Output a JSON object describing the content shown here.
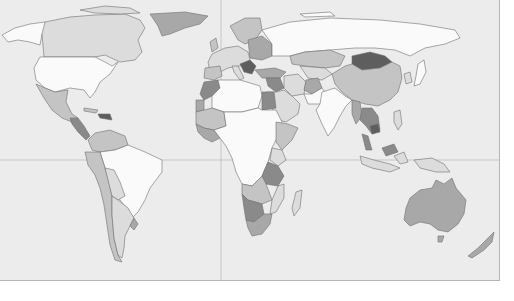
{
  "map": {
    "type": "choropleth-world-map",
    "colors": {
      "ocean": "#ececec",
      "frame_border": "#b5b5b5",
      "gridline": "#b8b8b8",
      "country_border": "#6e6e6e",
      "shade_0": "#fafafa",
      "shade_1": "#dcdcdc",
      "shade_2": "#c4c4c4",
      "shade_3": "#a8a8a8",
      "shade_4": "#8a8a8a",
      "shade_5": "#5e5e5e"
    },
    "gridlines": {
      "prime_meridian_x": 221,
      "equator_y": 160
    },
    "regions": [
      {
        "name": "alaska",
        "shade": "shade_0"
      },
      {
        "name": "canada",
        "shade": "shade_1"
      },
      {
        "name": "greenland",
        "shade": "shade_3"
      },
      {
        "name": "usa",
        "shade": "shade_0"
      },
      {
        "name": "mexico",
        "shade": "shade_2"
      },
      {
        "name": "central-america",
        "shade": "shade_4"
      },
      {
        "name": "caribbean",
        "shade": "shade_5"
      },
      {
        "name": "colombia-venezuela",
        "shade": "shade_2"
      },
      {
        "name": "brazil",
        "shade": "shade_0"
      },
      {
        "name": "peru-chile",
        "shade": "shade_2"
      },
      {
        "name": "bolivia-paraguay",
        "shade": "shade_1"
      },
      {
        "name": "argentina",
        "shade": "shade_1"
      },
      {
        "name": "uruguay",
        "shade": "shade_3"
      },
      {
        "name": "europe",
        "shade": "shade_2"
      },
      {
        "name": "balkans",
        "shade": "shade_5"
      },
      {
        "name": "russia",
        "shade": "shade_0"
      },
      {
        "name": "kazakhstan",
        "shade": "shade_2"
      },
      {
        "name": "mongolia",
        "shade": "shade_5"
      },
      {
        "name": "china",
        "shade": "shade_2"
      },
      {
        "name": "india",
        "shade": "shade_0"
      },
      {
        "name": "middle-east",
        "shade": "shade_1"
      },
      {
        "name": "turkey",
        "shade": "shade_3"
      },
      {
        "name": "iraq-syria",
        "shade": "shade_4"
      },
      {
        "name": "afghanistan",
        "shade": "shade_3"
      },
      {
        "name": "egypt",
        "shade": "shade_4"
      },
      {
        "name": "morocco",
        "shade": "shade_4"
      },
      {
        "name": "north-africa",
        "shade": "shade_0"
      },
      {
        "name": "mali-mauritania",
        "shade": "shade_2"
      },
      {
        "name": "central-africa",
        "shade": "shade_0"
      },
      {
        "name": "east-africa",
        "shade": "shade_2"
      },
      {
        "name": "tanzania",
        "shade": "shade_4"
      },
      {
        "name": "namibia-botswana",
        "shade": "shade_4"
      },
      {
        "name": "south-africa",
        "shade": "shade_3"
      },
      {
        "name": "madagascar",
        "shade": "shade_1"
      },
      {
        "name": "southeast-asia",
        "shade": "shade_4"
      },
      {
        "name": "myanmar",
        "shade": "shade_3"
      },
      {
        "name": "indonesia",
        "shade": "shade_1"
      },
      {
        "name": "japan",
        "shade": "shade_0"
      },
      {
        "name": "australia",
        "shade": "shade_3"
      },
      {
        "name": "new-zealand",
        "shade": "shade_3"
      }
    ]
  }
}
